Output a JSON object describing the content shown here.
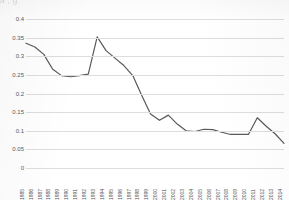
{
  "top_bleed_text": "a  ,                                                         g       ",
  "chart_data": {
    "type": "line",
    "title": "",
    "xlabel": "",
    "ylabel": "",
    "ylim": [
      0,
      0.4
    ],
    "ytick_labels": [
      "0.4",
      "0.35",
      "0.3",
      "0.25",
      "0.2",
      "0.15",
      "0.1",
      "0.05",
      "0"
    ],
    "ytick_values": [
      0.4,
      0.35,
      0.3,
      0.25,
      0.2,
      0.15,
      0.1,
      0.05,
      0
    ],
    "grid": true,
    "legend": false,
    "line_color": "#595959",
    "gridline_color": "#dddddd",
    "categories": [
      "1985",
      "1986",
      "1987",
      "1988",
      "1989",
      "1990",
      "1991",
      "1992",
      "1993",
      "1994",
      "1995",
      "1996",
      "1997",
      "1998",
      "1999",
      "2000",
      "2001",
      "2002",
      "2003",
      "2004",
      "2005",
      "2006",
      "2007",
      "2008",
      "2009",
      "2010",
      "2011",
      "2012",
      "2013",
      "2014"
    ],
    "values": [
      0.335,
      0.325,
      0.305,
      0.265,
      0.248,
      0.245,
      0.248,
      0.252,
      0.352,
      0.315,
      0.295,
      0.275,
      0.248,
      0.195,
      0.145,
      0.128,
      0.142,
      0.118,
      0.1,
      0.098,
      0.104,
      0.103,
      0.096,
      0.09,
      0.09,
      0.09,
      0.135,
      0.112,
      0.092,
      0.066
    ]
  }
}
